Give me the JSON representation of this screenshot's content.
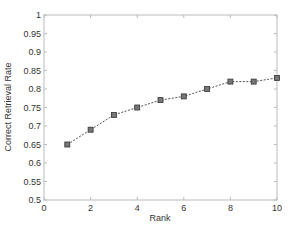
{
  "chart_data": {
    "type": "line",
    "title": "",
    "xlabel": "Rank",
    "ylabel": "Correct Retrieval Rate",
    "xlim": [
      0,
      10
    ],
    "ylim": [
      0.5,
      1
    ],
    "xticks": [
      0,
      2,
      4,
      6,
      8,
      10
    ],
    "xtick_labels": [
      "0",
      "2",
      "4",
      "6",
      "8",
      "10"
    ],
    "yticks": [
      0.5,
      0.55,
      0.6,
      0.65,
      0.7,
      0.75,
      0.8,
      0.85,
      0.9,
      0.95,
      1
    ],
    "ytick_labels": [
      "0.5",
      "0.55",
      "0.6",
      "0.65",
      "0.7",
      "0.75",
      "0.8",
      "0.85",
      "0.9",
      "0.95",
      "1"
    ],
    "grid": false,
    "legend": null,
    "x": [
      1,
      2,
      3,
      4,
      5,
      6,
      7,
      8,
      9,
      10
    ],
    "series": [
      {
        "name": "Correct Retrieval Rate",
        "values": [
          0.65,
          0.69,
          0.73,
          0.75,
          0.77,
          0.78,
          0.8,
          0.82,
          0.82,
          0.83
        ],
        "line_style": "dashed",
        "marker": "square",
        "color": "#555555"
      }
    ]
  }
}
